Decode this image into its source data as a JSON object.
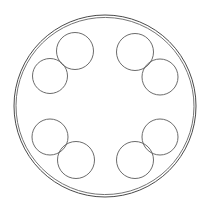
{
  "figure": {
    "type": "geometric-construction",
    "canvas": {
      "width": 210,
      "height": 213,
      "background": "#ffffff"
    },
    "stroke": {
      "color": "#555555",
      "width": 0.9
    },
    "center": {
      "x": 105,
      "y": 106
    },
    "outer_circles": [
      {
        "name": "outer-circle-primary",
        "cx": 105,
        "cy": 106,
        "r": 91,
        "stroke": "#4a4a4a",
        "stroke_width": 1.0
      },
      {
        "name": "outer-circle-secondary",
        "cx": 105,
        "cy": 106,
        "r": 89,
        "rotation_deg": 6,
        "stroke": "#6b6b6b",
        "stroke_width": 0.9
      }
    ],
    "satellite_ring": {
      "count": 8,
      "orbit_radius": 55,
      "circle_radius": 18.5,
      "stroke": "#5a5a5a",
      "stroke_width": 0.9,
      "circles": [
        {
          "name": "satellite-top-left",
          "cx": 75,
          "cy": 51,
          "r": 18.5,
          "angle_deg": 229
        },
        {
          "name": "satellite-top-right",
          "cx": 135,
          "cy": 52,
          "r": 18.5,
          "angle_deg": 311
        },
        {
          "name": "satellite-left-upper",
          "cx": 50,
          "cy": 76,
          "r": 17.5,
          "angle_deg": 185
        },
        {
          "name": "satellite-right-upper",
          "cx": 160,
          "cy": 77,
          "r": 18.0,
          "angle_deg": 355
        },
        {
          "name": "satellite-left-lower",
          "cx": 50,
          "cy": 137,
          "r": 18.0,
          "angle_deg": 150
        },
        {
          "name": "satellite-right-lower",
          "cx": 160,
          "cy": 137,
          "r": 18.0,
          "angle_deg": 30
        },
        {
          "name": "satellite-bottom-left",
          "cx": 76,
          "cy": 160,
          "r": 18.5,
          "angle_deg": 130
        },
        {
          "name": "satellite-bottom-right",
          "cx": 135,
          "cy": 160,
          "r": 18.5,
          "angle_deg": 49
        }
      ]
    },
    "labels": [],
    "annotations": []
  }
}
